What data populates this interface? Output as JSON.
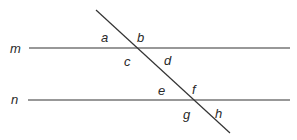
{
  "diagram": {
    "colors": {
      "line": "#333333",
      "label": "#2a2a2a",
      "background": "#ffffff"
    },
    "lines": {
      "m": {
        "label": "m",
        "x1": 29,
        "y1": 48,
        "x2": 290,
        "y2": 48,
        "label_x": 10,
        "label_y": 53
      },
      "n": {
        "label": "n",
        "x1": 28,
        "y1": 100,
        "x2": 290,
        "y2": 100,
        "label_x": 11,
        "label_y": 104
      },
      "transversal": {
        "x1": 96,
        "y1": 10,
        "x2": 230,
        "y2": 133
      }
    },
    "angles": [
      {
        "label": "a",
        "x": 101,
        "y": 42
      },
      {
        "label": "b",
        "x": 137,
        "y": 42
      },
      {
        "label": "c",
        "x": 124,
        "y": 66
      },
      {
        "label": "d",
        "x": 164,
        "y": 65
      },
      {
        "label": "e",
        "x": 158,
        "y": 95
      },
      {
        "label": "f",
        "x": 192,
        "y": 94
      },
      {
        "label": "g",
        "x": 183,
        "y": 119
      },
      {
        "label": "h",
        "x": 215,
        "y": 118
      }
    ]
  }
}
